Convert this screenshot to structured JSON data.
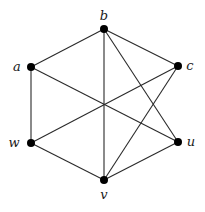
{
  "diagram": {
    "type": "graph",
    "directed": false,
    "nodes": [
      {
        "id": "a",
        "label": "a",
        "x": 31,
        "y": 67,
        "label_x": 17,
        "label_y": 71
      },
      {
        "id": "b",
        "label": "b",
        "x": 104,
        "y": 29,
        "label_x": 104,
        "label_y": 20
      },
      {
        "id": "c",
        "label": "c",
        "x": 178,
        "y": 66,
        "label_x": 190,
        "label_y": 70
      },
      {
        "id": "u",
        "label": "u",
        "x": 178,
        "y": 142,
        "label_x": 191,
        "label_y": 146
      },
      {
        "id": "v",
        "label": "v",
        "x": 104,
        "y": 180,
        "label_x": 104,
        "label_y": 199
      },
      {
        "id": "w",
        "label": "w",
        "x": 31,
        "y": 143,
        "label_x": 14,
        "label_y": 147
      }
    ],
    "edges": [
      [
        "a",
        "b"
      ],
      [
        "b",
        "c"
      ],
      [
        "a",
        "w"
      ],
      [
        "w",
        "v"
      ],
      [
        "v",
        "u"
      ],
      [
        "b",
        "v"
      ],
      [
        "a",
        "u"
      ],
      [
        "w",
        "c"
      ],
      [
        "b",
        "u"
      ],
      [
        "c",
        "v"
      ]
    ],
    "colors": {
      "edge": "#2a2a2a",
      "node": "#000000",
      "label": "#1a1a1a",
      "background": "#ffffff"
    }
  }
}
